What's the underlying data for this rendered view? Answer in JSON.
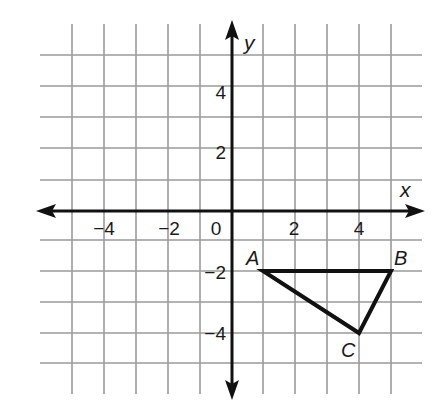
{
  "chart_data": {
    "type": "scatter",
    "title": "",
    "xlabel": "x",
    "ylabel": "y",
    "xlim": [
      -5.5,
      6
    ],
    "ylim": [
      -5.5,
      6
    ],
    "grid": true,
    "grid_step": 1,
    "x_ticks": [
      {
        "value": -4,
        "label": "−4"
      },
      {
        "value": -2,
        "label": "−2"
      },
      {
        "value": 0,
        "label": "0"
      },
      {
        "value": 2,
        "label": "2"
      },
      {
        "value": 4,
        "label": "4"
      }
    ],
    "y_ticks": [
      {
        "value": 4,
        "label": "4"
      },
      {
        "value": 2,
        "label": "2"
      },
      {
        "value": -2,
        "label": "−2"
      },
      {
        "value": -4,
        "label": "−4"
      }
    ],
    "shapes": [
      {
        "type": "triangle",
        "vertices": [
          {
            "label": "A",
            "x": 1,
            "y": -2
          },
          {
            "label": "B",
            "x": 5,
            "y": -2
          },
          {
            "label": "C",
            "x": 4,
            "y": -4
          }
        ]
      }
    ]
  },
  "axes": {
    "x_name": "x",
    "y_name": "y"
  },
  "labels": {
    "x_ticks": [
      "−4",
      "−2",
      "0",
      "2",
      "4"
    ],
    "y_ticks": [
      "4",
      "2",
      "−2",
      "−4"
    ],
    "vertices": [
      "A",
      "B",
      "C"
    ]
  },
  "colors": {
    "grid": "#9a9a9a",
    "axis": "#111111",
    "shape": "#111111",
    "background": "#ffffff"
  }
}
